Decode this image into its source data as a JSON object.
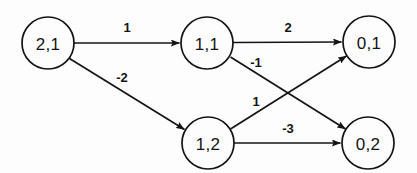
{
  "diagram": {
    "type": "directed-weighted-graph",
    "background_color": "#fdfdfd",
    "stroke_color": "#141414",
    "nodes": [
      {
        "id": "n21",
        "label": "2,1",
        "cx": 48,
        "cy": 43,
        "r": 26
      },
      {
        "id": "n11",
        "label": "1,1",
        "cx": 207,
        "cy": 43,
        "r": 26
      },
      {
        "id": "n01",
        "label": "0,1",
        "cx": 369,
        "cy": 42,
        "r": 26
      },
      {
        "id": "n12",
        "label": "1,2",
        "cx": 208,
        "cy": 143,
        "r": 26
      },
      {
        "id": "n02",
        "label": "0,2",
        "cx": 368,
        "cy": 143,
        "r": 26
      }
    ],
    "edges": [
      {
        "id": "e1",
        "from": "2,1",
        "to": "1,1",
        "weight": "1",
        "label_x": 127,
        "label_y": 27
      },
      {
        "id": "e2",
        "from": "2,1",
        "to": "1,2",
        "weight": "-2",
        "label_x": 122,
        "label_y": 77
      },
      {
        "id": "e3",
        "from": "1,1",
        "to": "0,1",
        "weight": "2",
        "label_x": 288,
        "label_y": 27
      },
      {
        "id": "e4",
        "from": "1,1",
        "to": "0,2",
        "weight": "-1",
        "label_x": 256,
        "label_y": 62
      },
      {
        "id": "e5",
        "from": "1,2",
        "to": "0,1",
        "weight": "1",
        "label_x": 256,
        "label_y": 101
      },
      {
        "id": "e6",
        "from": "1,2",
        "to": "0,2",
        "weight": "-3",
        "label_x": 288,
        "label_y": 128
      }
    ]
  }
}
